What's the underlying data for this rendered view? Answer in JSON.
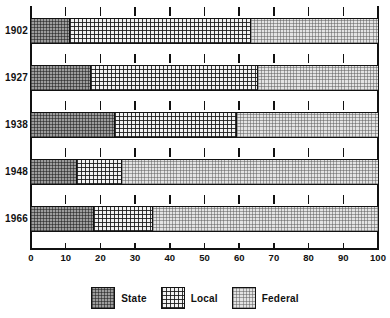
{
  "chart_data": {
    "type": "bar",
    "orientation": "horizontal",
    "stacked": true,
    "title": "",
    "subtitle": "",
    "xlabel": "",
    "ylabel": "",
    "xlim": [
      0,
      100
    ],
    "grid": false,
    "legend_position": "bottom",
    "categories": [
      "1902",
      "1927",
      "1938",
      "1948",
      "1966"
    ],
    "x_ticks": [
      0,
      10,
      20,
      30,
      40,
      50,
      60,
      70,
      80,
      90,
      100
    ],
    "x_tick_labels": [
      "0",
      "10",
      "20",
      "30",
      "40",
      "50",
      "60",
      "70",
      "80",
      "90",
      "100"
    ],
    "series": [
      {
        "name": "State",
        "values": [
          11,
          17,
          24,
          13,
          18
        ]
      },
      {
        "name": "Local",
        "values": [
          52,
          48,
          35,
          13,
          17
        ]
      },
      {
        "name": "Federal",
        "values": [
          37,
          35,
          41,
          74,
          65
        ]
      }
    ],
    "cumulative_boundaries": {
      "1902": [
        11,
        63,
        100
      ],
      "1927": [
        17,
        65,
        100
      ],
      "1938": [
        24,
        59,
        100
      ],
      "1948": [
        13,
        26,
        100
      ],
      "1966": [
        18,
        35,
        100
      ]
    },
    "colors": {
      "state": "#9d9d9d",
      "local": "#f2f2f2",
      "federal": "#e3e3e3",
      "axis": "#111111"
    }
  },
  "legend": {
    "entries": [
      {
        "label": "State",
        "pattern": "dark-checker-swatch"
      },
      {
        "label": "Local",
        "pattern": "dotted-swatch"
      },
      {
        "label": "Federal",
        "pattern": "light-stipple-swatch"
      }
    ]
  }
}
